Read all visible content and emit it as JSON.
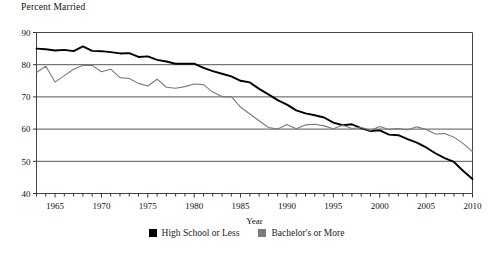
{
  "chart_data": {
    "type": "line",
    "title": "Percent Married",
    "xlabel": "Year",
    "ylabel": "",
    "xlim": [
      1963,
      2010
    ],
    "ylim": [
      40,
      90
    ],
    "yticks": [
      40,
      50,
      60,
      70,
      80,
      90
    ],
    "xticks": [
      1965,
      1970,
      1975,
      1980,
      1985,
      1990,
      1995,
      2000,
      2005,
      2010
    ],
    "xtick_minor_step": 1,
    "grid": "horizontal",
    "legend_position": "bottom-center",
    "x": [
      1963,
      1964,
      1965,
      1966,
      1967,
      1968,
      1969,
      1970,
      1971,
      1972,
      1973,
      1974,
      1975,
      1976,
      1977,
      1978,
      1979,
      1980,
      1981,
      1982,
      1983,
      1984,
      1985,
      1986,
      1987,
      1988,
      1989,
      1990,
      1991,
      1992,
      1993,
      1994,
      1995,
      1996,
      1997,
      1998,
      1999,
      2000,
      2001,
      2002,
      2003,
      2004,
      2005,
      2006,
      2007,
      2008,
      2009,
      2010
    ],
    "series": [
      {
        "name": "High School or Less",
        "color": "#000000",
        "width": 1.9,
        "values": [
          85.0,
          84.8,
          84.4,
          84.6,
          84.2,
          85.7,
          84.3,
          84.2,
          83.9,
          83.5,
          83.6,
          82.4,
          82.6,
          81.5,
          81.0,
          80.3,
          80.3,
          80.3,
          79.0,
          78.0,
          77.2,
          76.4,
          75.0,
          74.5,
          72.5,
          70.8,
          69.0,
          67.6,
          65.8,
          64.9,
          64.3,
          63.6,
          62.0,
          61.2,
          61.5,
          60.3,
          59.4,
          59.6,
          58.3,
          58.1,
          56.9,
          55.8,
          54.3,
          52.5,
          51.0,
          49.8,
          47.0,
          44.5
        ]
      },
      {
        "name": "Bachelor's or More",
        "color": "#7a7a7a",
        "width": 1.1,
        "values": [
          77.6,
          79.5,
          74.6,
          76.6,
          78.6,
          79.8,
          79.8,
          77.8,
          78.6,
          76.0,
          75.7,
          74.2,
          73.4,
          75.5,
          73.0,
          72.7,
          73.2,
          74.0,
          73.8,
          71.5,
          70.1,
          70.1,
          66.8,
          64.7,
          62.6,
          60.5,
          60.0,
          61.4,
          60.1,
          61.3,
          61.5,
          61.0,
          60.1,
          61.2,
          60.2,
          60.5,
          59.6,
          60.8,
          59.9,
          60.2,
          59.8,
          60.7,
          59.9,
          58.5,
          58.6,
          57.5,
          55.5,
          53.0
        ]
      }
    ]
  },
  "legend": {
    "entries": [
      {
        "label": "High School or Less",
        "color": "#000000"
      },
      {
        "label": "Bachelor's or More",
        "color": "#7a7a7a"
      }
    ]
  }
}
